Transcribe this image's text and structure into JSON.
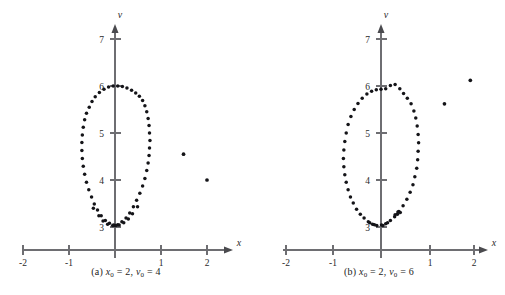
{
  "figure": {
    "title": "",
    "background": "#ffffff",
    "point_color": "#141418",
    "axis_color": "#6e6e72",
    "panel_count": 2
  },
  "panels": [
    {
      "id": "panel-a",
      "caption_prefix": "(a)",
      "caption_text": "(a) x0 = 2, v0 = 4",
      "caption_parts": {
        "label": "(a)",
        "var1": "x",
        "sub1": "0",
        "eq1": "= 2,",
        "var2": "v",
        "sub2": "0",
        "eq2": "= 4"
      },
      "chart_data": {
        "type": "scatter",
        "title": "(a) x0 = 2, v0 = 4",
        "xlabel": "x",
        "ylabel": "v",
        "xlim": [
          -2.35,
          2.35
        ],
        "ylim": [
          2.55,
          7.45
        ],
        "xticks": [
          -2,
          -1,
          1,
          2
        ],
        "xticklabels": [
          "-2",
          "-1",
          "1",
          "2"
        ],
        "yticks": [
          3,
          4,
          5,
          6,
          7
        ],
        "yticklabels": [
          "3",
          "4",
          "5",
          "6",
          "7"
        ],
        "grid": false,
        "legend": null,
        "series": [
          {
            "name": "orbit",
            "description": "closed elliptical orbit, center approx (-0.05, 4.5), semi-axes approx 0.72 by 1.5",
            "points": [
              [
                -0.04,
                6.0
              ],
              [
                0.06,
                6.0
              ],
              [
                0.16,
                5.99
              ],
              [
                -0.14,
                5.98
              ],
              [
                0.26,
                5.96
              ],
              [
                -0.24,
                5.93
              ],
              [
                0.36,
                5.91
              ],
              [
                0.45,
                5.85
              ],
              [
                -0.34,
                5.86
              ],
              [
                0.53,
                5.78
              ],
              [
                -0.43,
                5.77
              ],
              [
                0.6,
                5.69
              ],
              [
                -0.5,
                5.67
              ],
              [
                0.65,
                5.58
              ],
              [
                -0.56,
                5.55
              ],
              [
                0.69,
                5.45
              ],
              [
                -0.62,
                5.42
              ],
              [
                0.72,
                5.31
              ],
              [
                -0.66,
                5.28
              ],
              [
                0.74,
                5.16
              ],
              [
                -0.69,
                5.12
              ],
              [
                0.75,
                5.0
              ],
              [
                -0.71,
                4.96
              ],
              [
                0.76,
                4.84
              ],
              [
                -0.72,
                4.8
              ],
              [
                0.75,
                4.68
              ],
              [
                -0.72,
                4.63
              ],
              [
                0.74,
                4.52
              ],
              [
                -0.71,
                4.46
              ],
              [
                0.72,
                4.36
              ],
              [
                -0.69,
                4.29
              ],
              [
                0.69,
                4.2
              ],
              [
                -0.66,
                4.12
              ],
              [
                0.65,
                4.03
              ],
              [
                -0.62,
                3.95
              ],
              [
                0.6,
                3.87
              ],
              [
                -0.57,
                3.79
              ],
              [
                0.54,
                3.72
              ],
              [
                -0.51,
                3.64
              ],
              [
                0.47,
                3.57
              ],
              [
                -0.45,
                3.49
              ],
              [
                0.4,
                3.43
              ],
              [
                -0.38,
                3.36
              ],
              [
                0.32,
                3.3
              ],
              [
                -0.3,
                3.24
              ],
              [
                0.24,
                3.19
              ],
              [
                -0.21,
                3.14
              ],
              [
                0.15,
                3.11
              ],
              [
                -0.12,
                3.08
              ],
              [
                0.06,
                3.05
              ],
              [
                -0.03,
                3.04
              ],
              [
                0.0,
                3.03
              ],
              [
                0.02,
                3.03
              ],
              [
                -0.05,
                3.03
              ],
              [
                0.09,
                3.04
              ],
              [
                0.19,
                3.09
              ],
              [
                0.29,
                3.17
              ],
              [
                -0.16,
                3.06
              ],
              [
                -0.26,
                3.13
              ],
              [
                0.38,
                3.28
              ],
              [
                -0.35,
                3.24
              ],
              [
                0.49,
                3.43
              ],
              [
                -0.47,
                3.4
              ]
            ]
          },
          {
            "name": "outliers",
            "description": "two isolated stray points at right of the orbit",
            "points": [
              [
                1.49,
                4.55
              ],
              [
                2.0,
                4.0
              ]
            ]
          }
        ]
      }
    },
    {
      "id": "panel-b",
      "caption_prefix": "(b)",
      "caption_text": "(b) x0 = 2, v0 = 6",
      "caption_parts": {
        "label": "(b)",
        "var1": "x",
        "sub1": "0",
        "eq1": "= 2,",
        "var2": "v",
        "sub2": "0",
        "eq2": "= 6"
      },
      "chart_data": {
        "type": "scatter",
        "title": "(b) x0 = 2, v0 = 6",
        "xlabel": "x",
        "ylabel": "v",
        "xlim": [
          -2.35,
          2.35
        ],
        "ylim": [
          2.55,
          7.45
        ],
        "xticks": [
          -2,
          -1,
          1,
          2
        ],
        "xticklabels": [
          "-2",
          "-1",
          "1",
          "2"
        ],
        "yticks": [
          3,
          4,
          5,
          6,
          7
        ],
        "yticklabels": [
          "3",
          "4",
          "5",
          "6",
          "7"
        ],
        "grid": false,
        "legend": null,
        "series": [
          {
            "name": "orbit",
            "description": "closed elliptical orbit, center approx (-0.04, 4.5), semi-axes approx 0.78 by 1.52",
            "points": [
              [
                0.0,
                5.93
              ],
              [
                0.1,
                5.94
              ],
              [
                0.2,
                6.01
              ],
              [
                0.3,
                6.03
              ],
              [
                -0.1,
                5.92
              ],
              [
                -0.2,
                5.89
              ],
              [
                0.4,
                5.94
              ],
              [
                -0.3,
                5.83
              ],
              [
                0.48,
                5.84
              ],
              [
                -0.4,
                5.74
              ],
              [
                0.56,
                5.74
              ],
              [
                -0.49,
                5.63
              ],
              [
                0.64,
                5.62
              ],
              [
                -0.57,
                5.5
              ],
              [
                0.7,
                5.47
              ],
              [
                -0.64,
                5.35
              ],
              [
                0.74,
                5.32
              ],
              [
                -0.7,
                5.18
              ],
              [
                0.77,
                5.15
              ],
              [
                -0.74,
                5.0
              ],
              [
                0.79,
                4.97
              ],
              [
                -0.77,
                4.82
              ],
              [
                0.8,
                4.79
              ],
              [
                -0.79,
                4.64
              ],
              [
                0.79,
                4.61
              ],
              [
                -0.8,
                4.46
              ],
              [
                0.78,
                4.43
              ],
              [
                -0.79,
                4.28
              ],
              [
                0.76,
                4.25
              ],
              [
                -0.77,
                4.11
              ],
              [
                0.72,
                4.07
              ],
              [
                -0.74,
                3.95
              ],
              [
                0.68,
                3.9
              ],
              [
                -0.7,
                3.79
              ],
              [
                0.62,
                3.74
              ],
              [
                -0.65,
                3.64
              ],
              [
                0.55,
                3.59
              ],
              [
                -0.59,
                3.51
              ],
              [
                0.47,
                3.45
              ],
              [
                -0.52,
                3.38
              ],
              [
                0.38,
                3.33
              ],
              [
                -0.44,
                3.27
              ],
              [
                0.29,
                3.22
              ],
              [
                -0.36,
                3.19
              ],
              [
                0.2,
                3.14
              ],
              [
                -0.27,
                3.11
              ],
              [
                0.1,
                3.07
              ],
              [
                -0.18,
                3.06
              ],
              [
                0.01,
                3.04
              ],
              [
                -0.09,
                3.03
              ],
              [
                0.04,
                3.03
              ],
              [
                0.35,
                3.27
              ],
              [
                0.41,
                3.31
              ],
              [
                0.36,
                3.32
              ],
              [
                0.3,
                3.26
              ],
              [
                0.14,
                3.09
              ],
              [
                -0.14,
                3.05
              ],
              [
                -0.24,
                3.09
              ]
            ]
          },
          {
            "name": "outliers",
            "description": "two isolated stray points at upper right of the orbit",
            "points": [
              [
                1.9,
                6.12
              ],
              [
                1.35,
                5.62
              ]
            ]
          }
        ]
      }
    }
  ]
}
